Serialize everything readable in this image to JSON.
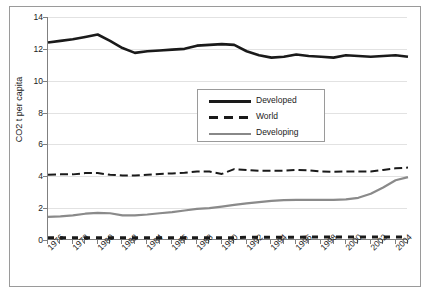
{
  "chart_data": {
    "type": "line",
    "title": "",
    "xlabel": "",
    "ylabel": "CO2 t per capita",
    "xlim": [
      1976,
      2005
    ],
    "ylim": [
      0,
      14
    ],
    "ytick_step": 2,
    "xtick_step": 2,
    "grid": true,
    "legend_position": "upper-center",
    "x": [
      1976,
      1977,
      1978,
      1979,
      1980,
      1981,
      1982,
      1983,
      1984,
      1985,
      1986,
      1987,
      1988,
      1989,
      1990,
      1991,
      1992,
      1993,
      1994,
      1995,
      1996,
      1997,
      1998,
      1999,
      2000,
      2001,
      2002,
      2003,
      2004,
      2005
    ],
    "xticklabels": [
      "1976",
      "1978",
      "1980",
      "1982",
      "1984",
      "1986",
      "1988",
      "1990",
      "1992",
      "1994",
      "1996",
      "1998",
      "2000",
      "2002",
      "2004"
    ],
    "yticklabels": [
      "0",
      "2",
      "4",
      "6",
      "8",
      "10",
      "12",
      "14"
    ],
    "series": [
      {
        "name": "Developed",
        "style": "solid",
        "color": "#1a1a1a",
        "width": 2.6,
        "values": [
          12.4,
          12.5,
          12.6,
          12.75,
          12.9,
          12.5,
          12.05,
          11.75,
          11.85,
          11.9,
          11.95,
          12.0,
          12.2,
          12.25,
          12.3,
          12.25,
          11.85,
          11.6,
          11.45,
          11.5,
          11.65,
          11.55,
          11.5,
          11.45,
          11.6,
          11.55,
          11.5,
          11.55,
          11.6,
          11.5
        ]
      },
      {
        "name": "World",
        "style": "dashed",
        "color": "#1a1a1a",
        "width": 2.0,
        "values": [
          4.1,
          4.12,
          4.12,
          4.2,
          4.2,
          4.1,
          4.05,
          4.05,
          4.1,
          4.15,
          4.18,
          4.22,
          4.3,
          4.3,
          4.15,
          4.45,
          4.4,
          4.35,
          4.35,
          4.35,
          4.4,
          4.38,
          4.3,
          4.28,
          4.3,
          4.3,
          4.3,
          4.4,
          4.5,
          4.55
        ]
      },
      {
        "name": "Developing",
        "style": "solid",
        "color": "#8a8a8a",
        "width": 2.2,
        "values": [
          1.45,
          1.48,
          1.55,
          1.65,
          1.7,
          1.68,
          1.55,
          1.55,
          1.6,
          1.68,
          1.75,
          1.85,
          1.95,
          2.0,
          2.1,
          2.2,
          2.3,
          2.38,
          2.45,
          2.5,
          2.52,
          2.52,
          2.52,
          2.52,
          2.55,
          2.65,
          2.9,
          3.3,
          3.75,
          3.95
        ]
      },
      {
        "name": "",
        "style": "dashed-thick",
        "color": "#1a1a1a",
        "width": 3.0,
        "values": [
          0.14,
          0.14,
          0.14,
          0.14,
          0.14,
          0.14,
          0.14,
          0.14,
          0.14,
          0.14,
          0.14,
          0.14,
          0.14,
          0.14,
          0.14,
          0.14,
          0.17,
          0.17,
          0.17,
          0.17,
          0.17,
          0.19,
          0.19,
          0.19,
          0.19,
          0.19,
          0.19,
          0.19,
          0.19,
          0.19
        ]
      }
    ],
    "legend_entries": [
      {
        "label": "Developed",
        "style": "solid-black"
      },
      {
        "label": "World",
        "style": "dashed-black"
      },
      {
        "label": "Developing",
        "style": "solid-gray"
      }
    ]
  }
}
